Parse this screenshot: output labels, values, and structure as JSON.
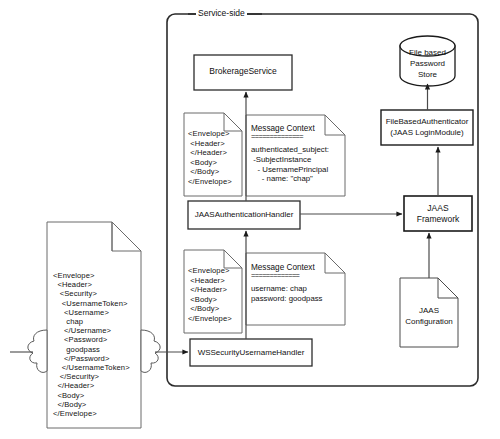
{
  "diagram": {
    "boundary": {
      "label": "Service-side",
      "shape": "rounded-rectangle"
    },
    "colors": {
      "stroke": "#1a1a1a",
      "fill": "#ffffff",
      "text": "#111111"
    },
    "nodes": {
      "brokerage_service": {
        "label": "BrokerageService",
        "shape": "rectangle"
      },
      "jaas_authentication_handler": {
        "label": "JAASAuthenticationHandler",
        "shape": "rectangle"
      },
      "wssecurity_username_handler": {
        "label": "WSSecurityUsernameHandler",
        "shape": "rectangle"
      },
      "jaas_framework": {
        "label_line1": "JAAS",
        "label_line2": "Framework",
        "shape": "rectangle"
      },
      "file_based_authenticator": {
        "label_line1": "FileBasedAuthenticator",
        "label_line2": "(JAAS LoginModule)",
        "shape": "rectangle"
      },
      "password_store": {
        "label_line1": "File based",
        "label_line2": "Password",
        "label_line3": "Store",
        "shape": "cylinder"
      },
      "jaas_configuration": {
        "label_line1": "JAAS",
        "label_line2": "Configuration",
        "shape": "document"
      }
    },
    "documents": {
      "incoming_soap_message": {
        "shape": "document",
        "lines": [
          "<Envelope>",
          "  <Header>",
          "   <Security>",
          "    <UsernameToken>",
          "     <Username>",
          "      chap",
          "     </Username>",
          "     <Password>",
          "      goodpass",
          "     </Password>",
          "    </UsernameToken>",
          "   </Security>",
          "  </Header>",
          "  <Body>",
          "  </Body>",
          "</Envelope>"
        ]
      },
      "stripped_soap_top": {
        "shape": "document",
        "lines": [
          "<Envelope>",
          " <Header>",
          " </Header>",
          " <Body>",
          " </Body>",
          "</Envelope>"
        ]
      },
      "stripped_soap_bottom": {
        "shape": "document",
        "lines": [
          "<Envelope>",
          " <Header>",
          " </Header>",
          " <Body>",
          " </Body>",
          "</Envelope>"
        ]
      },
      "message_context_top": {
        "shape": "document",
        "title": "Message Context",
        "rule": "==============",
        "lines": [
          "authenticated_subject:",
          " -SubjectInstance",
          "   - UsernamePrincipal",
          "     - name: \"chap\""
        ]
      },
      "message_context_bottom": {
        "shape": "document",
        "title": "Message Context",
        "rule": "=============",
        "lines": [
          "username: chap",
          "password: goodpass"
        ]
      }
    },
    "connectors": [
      {
        "name": "cloud-to-wssecurity-handler",
        "from": "incoming_soap_message",
        "to": "wssecurity_username_handler",
        "arrow": true
      },
      {
        "name": "wssecurity-handler-to-jaas-auth-handler",
        "from": "wssecurity_username_handler",
        "to": "jaas_authentication_handler",
        "arrow": true
      },
      {
        "name": "jaas-auth-handler-to-brokerage-service",
        "from": "jaas_authentication_handler",
        "to": "brokerage_service",
        "arrow": true
      },
      {
        "name": "jaas-auth-handler-to-jaas-framework",
        "from": "jaas_authentication_handler",
        "to": "jaas_framework",
        "arrow": true
      },
      {
        "name": "jaas-framework-to-file-based-authenticator",
        "from": "jaas_framework",
        "to": "file_based_authenticator",
        "arrow": true
      },
      {
        "name": "file-based-authenticator-to-password-store",
        "from": "file_based_authenticator",
        "to": "password_store",
        "arrow": true
      },
      {
        "name": "jaas-configuration-to-jaas-framework",
        "from": "jaas_configuration",
        "to": "jaas_framework",
        "arrow": true
      }
    ]
  }
}
